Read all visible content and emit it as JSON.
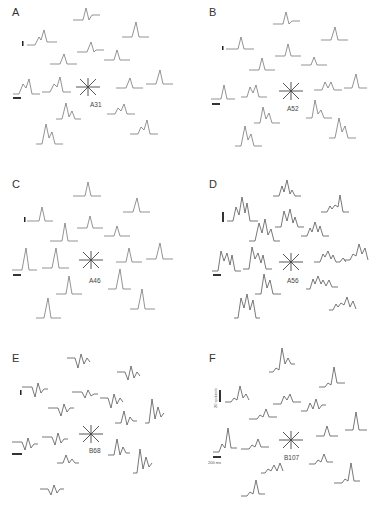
{
  "figure": {
    "panels": [
      {
        "label": "A",
        "cell": "A31",
        "response_type": "single peak, two overlaid traces"
      },
      {
        "label": "B",
        "cell": "A52",
        "response_type": "single/double peak"
      },
      {
        "label": "C",
        "cell": "A46",
        "response_type": "single sharp peak"
      },
      {
        "label": "D",
        "cell": "A56",
        "response_type": "multi-peak, noisy"
      },
      {
        "label": "E",
        "cell": "B68",
        "response_type": "biphasic"
      },
      {
        "label": "F",
        "cell": "B107",
        "response_type": "sharp peak"
      }
    ],
    "scale_bars": {
      "vertical_label": "20 spikes/s",
      "horizontal_label": "200 ms"
    },
    "direction_icon": "eight-direction-star-icon"
  }
}
